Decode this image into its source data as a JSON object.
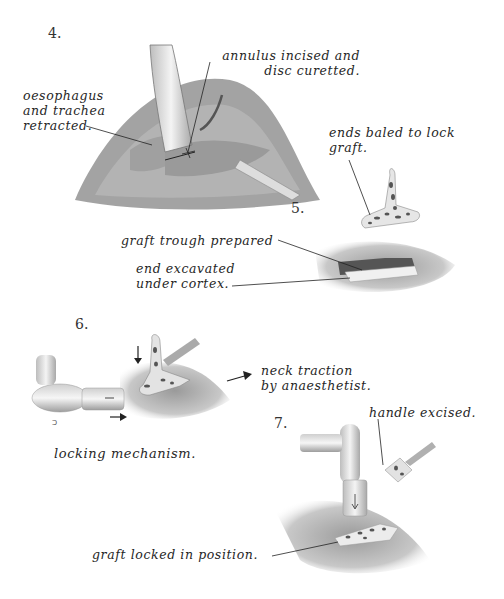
{
  "steps": [
    {
      "number": "4.",
      "labels": {
        "annulus_line1": "annulus incised and",
        "annulus_line2": "disc curetted.",
        "oeso_line1": "oesophagus",
        "oeso_line2": "and trachea",
        "oeso_line3": "retracted."
      }
    },
    {
      "number": "5.",
      "labels": {
        "ends_line1": "ends baled to lock",
        "ends_line2": "graft.",
        "trough": "graft trough prepared",
        "end_line1": "end excavated",
        "end_line2": "under cortex."
      }
    },
    {
      "number": "6.",
      "labels": {
        "traction_line1": "neck traction",
        "traction_line2": "by anaesthetist.",
        "locking": "locking mechanism."
      }
    },
    {
      "number": "7.",
      "labels": {
        "handle": "handle excised.",
        "locked": "graft locked in position."
      }
    }
  ],
  "colors": {
    "ink": "#262626",
    "tissue_dark": "#6a6a6a",
    "tissue_light": "#cfcfcf",
    "graft_spots": "#444444"
  }
}
